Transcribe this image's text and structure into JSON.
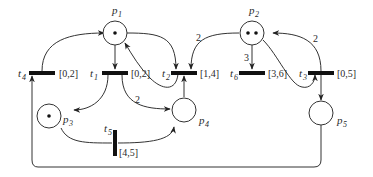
{
  "diagram": {
    "type": "petri-net",
    "colors": {
      "stroke": "#333333",
      "fill": "#ffffff",
      "transition": "#111111"
    },
    "places": [
      {
        "id": "p1",
        "label": "p",
        "sub": "1",
        "tokens": 1
      },
      {
        "id": "p2",
        "label": "p",
        "sub": "2",
        "tokens": 2
      },
      {
        "id": "p3",
        "label": "p",
        "sub": "3",
        "tokens": 1
      },
      {
        "id": "p4",
        "label": "p",
        "sub": "4",
        "tokens": 0
      },
      {
        "id": "p5",
        "label": "p",
        "sub": "5",
        "tokens": 0
      }
    ],
    "transitions": [
      {
        "id": "t1",
        "label": "t",
        "sub": "1",
        "interval": "[0,2]"
      },
      {
        "id": "t2",
        "label": "t",
        "sub": "2",
        "interval": "[1,4]"
      },
      {
        "id": "t3",
        "label": "t",
        "sub": "3",
        "interval": "[0,5]"
      },
      {
        "id": "t4",
        "label": "t",
        "sub": "4",
        "interval": "[0,2]"
      },
      {
        "id": "t5",
        "label": "t",
        "sub": "5",
        "interval": "[4,5]"
      },
      {
        "id": "t6",
        "label": "t",
        "sub": "6",
        "interval": "[3,6]"
      }
    ],
    "arcs": [
      {
        "from": "t4",
        "to": "p1",
        "weight": ""
      },
      {
        "from": "p1",
        "to": "t1",
        "weight": ""
      },
      {
        "from": "p1",
        "to": "t2",
        "weight": ""
      },
      {
        "from": "t2",
        "to": "p1",
        "weight": ""
      },
      {
        "from": "p2",
        "to": "t2",
        "weight": "2"
      },
      {
        "from": "p2",
        "to": "t6",
        "weight": "3"
      },
      {
        "from": "p2",
        "to": "t3",
        "weight": ""
      },
      {
        "from": "t3",
        "to": "p2",
        "weight": "2"
      },
      {
        "from": "t3",
        "to": "p5",
        "weight": ""
      },
      {
        "from": "t1",
        "to": "p3",
        "weight": ""
      },
      {
        "from": "t1",
        "to": "p4",
        "weight": "2"
      },
      {
        "from": "p3",
        "to": "t5",
        "weight": ""
      },
      {
        "from": "t5",
        "to": "p4",
        "weight": ""
      },
      {
        "from": "p4",
        "to": "t2",
        "weight": ""
      },
      {
        "from": "p5",
        "to": "t4",
        "weight": ""
      }
    ],
    "weights": {
      "p2_t2": "2",
      "p2_t6": "3",
      "t3_p2": "2",
      "t1_p4": "2"
    }
  }
}
